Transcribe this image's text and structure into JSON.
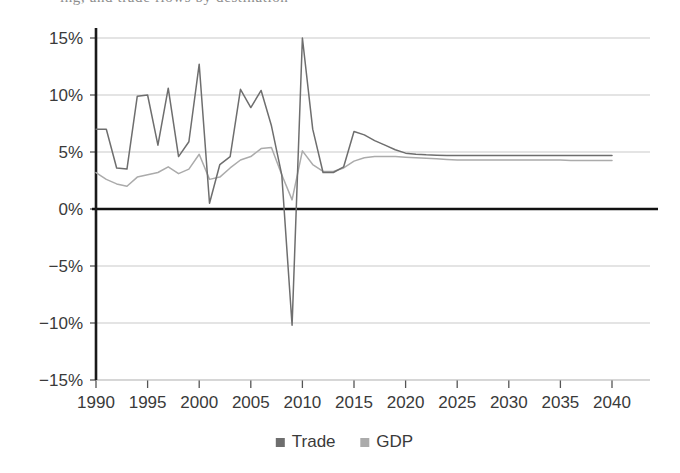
{
  "page": {
    "cropped_header_text": "ing, and trade flows by destination",
    "background_color": "#ffffff"
  },
  "chart_data": {
    "type": "line",
    "title": "",
    "subtitle": "",
    "xlabel": "",
    "ylabel": "",
    "xlim": [
      1990,
      2040
    ],
    "ylim": [
      -15,
      15
    ],
    "grid": true,
    "grid_axis": "y",
    "zero_line": true,
    "legend_position": "bottom",
    "y_tick_labels": [
      "15%",
      "10%",
      "5%",
      "0%",
      "-5%",
      "-10%",
      "-15%"
    ],
    "y_ticks": [
      15,
      10,
      5,
      0,
      -5,
      -10,
      -15
    ],
    "x_tick_labels": [
      "1990",
      "1995",
      "2000",
      "2005",
      "2010",
      "2015",
      "2020",
      "2025",
      "2030",
      "2035",
      "2040"
    ],
    "x_ticks": [
      1990,
      1995,
      2000,
      2005,
      2010,
      2015,
      2020,
      2025,
      2030,
      2035,
      2040
    ],
    "x": [
      1990,
      1991,
      1992,
      1993,
      1994,
      1995,
      1996,
      1997,
      1998,
      1999,
      2000,
      2001,
      2002,
      2003,
      2004,
      2005,
      2006,
      2007,
      2008,
      2009,
      2010,
      2011,
      2012,
      2013,
      2014,
      2015,
      2016,
      2017,
      2018,
      2019,
      2020,
      2021,
      2022,
      2023,
      2024,
      2025,
      2026,
      2027,
      2028,
      2029,
      2030,
      2031,
      2032,
      2033,
      2034,
      2035,
      2036,
      2037,
      2038,
      2039,
      2040
    ],
    "series": [
      {
        "name": "Trade",
        "color": "#6e6e6e",
        "values": [
          7.0,
          7.0,
          3.6,
          3.5,
          9.9,
          10.0,
          5.6,
          10.6,
          4.6,
          5.9,
          12.7,
          0.5,
          3.9,
          4.6,
          10.5,
          8.9,
          10.4,
          7.3,
          3.0,
          -10.2,
          15.0,
          7.0,
          3.2,
          3.2,
          3.7,
          6.8,
          6.5,
          6.0,
          5.6,
          5.2,
          4.9,
          4.8,
          4.75,
          4.72,
          4.7,
          4.7,
          4.7,
          4.7,
          4.7,
          4.7,
          4.7,
          4.7,
          4.7,
          4.7,
          4.7,
          4.7,
          4.7,
          4.7,
          4.7,
          4.7,
          4.7
        ]
      },
      {
        "name": "GDP",
        "color": "#ababab",
        "values": [
          3.2,
          2.6,
          2.2,
          2.0,
          2.8,
          3.0,
          3.2,
          3.7,
          3.1,
          3.5,
          4.8,
          2.6,
          2.8,
          3.6,
          4.3,
          4.6,
          5.3,
          5.4,
          3.0,
          0.8,
          5.1,
          3.9,
          3.3,
          3.3,
          3.6,
          4.2,
          4.5,
          4.6,
          4.6,
          4.6,
          4.55,
          4.5,
          4.45,
          4.4,
          4.35,
          4.3,
          4.3,
          4.3,
          4.3,
          4.3,
          4.3,
          4.3,
          4.3,
          4.3,
          4.3,
          4.3,
          4.25,
          4.25,
          4.25,
          4.25,
          4.25
        ]
      }
    ],
    "legend": [
      {
        "label": "Trade",
        "color": "#6e6e6e",
        "marker": "square"
      },
      {
        "label": "GDP",
        "color": "#ababab",
        "marker": "square"
      }
    ],
    "axis_colors": {
      "axis_line": "#1a1a1a",
      "zero_line": "#111111",
      "grid_line": "#c9c9c9",
      "tick": "#555555"
    }
  }
}
